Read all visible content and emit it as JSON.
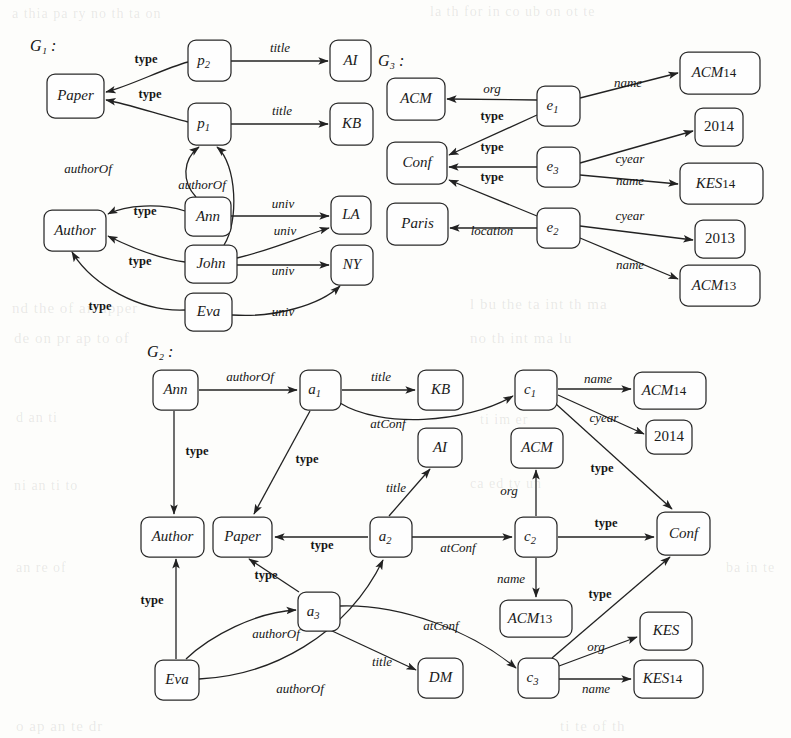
{
  "figure": {
    "width": 791,
    "height": 738,
    "background": "#fdfdfb",
    "ink_color": "#222222"
  },
  "graphs": [
    {
      "id": "G1",
      "title": "G₁ :",
      "title_x": 30,
      "title_y": 47,
      "nodes": [
        {
          "key": "g1-paper",
          "label": "Paper",
          "x": 47,
          "y": 74,
          "w": 57,
          "h": 44,
          "style": "italic"
        },
        {
          "key": "g1-p2",
          "label": "p",
          "sub": "2",
          "x": 188,
          "y": 40,
          "w": 43,
          "h": 41,
          "style": "italic"
        },
        {
          "key": "g1-p1",
          "label": "p",
          "sub": "1",
          "x": 188,
          "y": 103,
          "w": 43,
          "h": 42,
          "style": "italic"
        },
        {
          "key": "g1-ai",
          "label": "AI",
          "x": 330,
          "y": 40,
          "w": 41,
          "h": 41,
          "style": "italic"
        },
        {
          "key": "g1-kb",
          "label": "KB",
          "x": 330,
          "y": 103,
          "w": 43,
          "h": 42,
          "style": "italic"
        },
        {
          "key": "g1-author",
          "label": "Author",
          "x": 44,
          "y": 210,
          "w": 62,
          "h": 41,
          "style": "italic"
        },
        {
          "key": "g1-ann",
          "label": "Ann",
          "x": 185,
          "y": 197,
          "w": 46,
          "h": 39,
          "style": "italic"
        },
        {
          "key": "g1-john",
          "label": "John",
          "x": 185,
          "y": 245,
          "w": 52,
          "h": 38,
          "style": "italic"
        },
        {
          "key": "g1-eva",
          "label": "Eva",
          "x": 185,
          "y": 293,
          "w": 47,
          "h": 38,
          "style": "italic"
        },
        {
          "key": "g1-la",
          "label": "LA",
          "x": 331,
          "y": 196,
          "w": 40,
          "h": 38,
          "style": "italic"
        },
        {
          "key": "g1-ny",
          "label": "NY",
          "x": 331,
          "y": 245,
          "w": 42,
          "h": 40,
          "style": "italic"
        }
      ],
      "edges": [
        {
          "key": "g1-e-p2-paper",
          "label": "type",
          "lx": 146,
          "ly": 60,
          "bold": true,
          "d": "M 188,62 C 165,68 130,86 106,92"
        },
        {
          "key": "g1-e-p2-ai",
          "label": "title",
          "lx": 280,
          "ly": 49,
          "bold": false,
          "d": "M 231,61 L 328,61"
        },
        {
          "key": "g1-e-p1-paper",
          "label": "type",
          "lx": 150,
          "ly": 95,
          "bold": true,
          "d": "M 188,122 C 163,116 128,104 106,100"
        },
        {
          "key": "g1-e-p1-kb",
          "label": "title",
          "lx": 282,
          "ly": 112,
          "bold": false,
          "d": "M 231,124 L 328,124"
        },
        {
          "key": "g1-e-ann-p1",
          "label": "authorOf",
          "lx": 88,
          "ly": 170,
          "bold": false,
          "d": "M 196,197 C 182,182 182,160 199,147"
        },
        {
          "key": "g1-e-john-p1",
          "label": "authorOf",
          "lx": 202,
          "ly": 186,
          "bold": false,
          "d": "M 224,245 C 239,222 237,164 217,147"
        },
        {
          "key": "g1-e-ann-author",
          "label": "type",
          "lx": 145,
          "ly": 212,
          "bold": true,
          "d": "M 185,211 C 160,203 126,205 108,214"
        },
        {
          "key": "g1-e-ann-la",
          "label": "univ",
          "lx": 283,
          "ly": 205,
          "bold": false,
          "d": "M 231,216 L 329,216"
        },
        {
          "key": "g1-e-john-author",
          "label": "type",
          "lx": 140,
          "ly": 262,
          "bold": true,
          "d": "M 185,262 C 155,258 122,243 108,236"
        },
        {
          "key": "g1-e-john-la",
          "label": "univ",
          "lx": 285,
          "ly": 232,
          "bold": false,
          "d": "M 237,258 C 275,249 308,234 329,228"
        },
        {
          "key": "g1-e-john-ny",
          "label": "univ",
          "lx": 283,
          "ly": 272,
          "bold": false,
          "d": "M 237,265 L 329,265"
        },
        {
          "key": "g1-e-eva-author",
          "label": "type",
          "lx": 100,
          "ly": 307,
          "bold": true,
          "d": "M 185,310 C 140,312 92,285 72,252"
        },
        {
          "key": "g1-e-eva-ny",
          "label": "univ",
          "lx": 283,
          "ly": 313,
          "bold": false,
          "d": "M 232,315 C 275,318 320,305 340,286"
        }
      ]
    },
    {
      "id": "G3",
      "title": "G₃ :",
      "title_x": 378,
      "title_y": 62,
      "nodes": [
        {
          "key": "g3-acm",
          "label": "ACM",
          "x": 387,
          "y": 78,
          "w": 58,
          "h": 42,
          "style": "italic"
        },
        {
          "key": "g3-conf",
          "label": "Conf",
          "x": 387,
          "y": 142,
          "w": 60,
          "h": 42,
          "style": "italic"
        },
        {
          "key": "g3-paris",
          "label": "Paris",
          "x": 387,
          "y": 203,
          "w": 61,
          "h": 42,
          "style": "italic"
        },
        {
          "key": "g3-e1",
          "label": "e",
          "sub": "1",
          "x": 537,
          "y": 86,
          "w": 43,
          "h": 40,
          "style": "italic"
        },
        {
          "key": "g3-e3",
          "label": "e",
          "sub": "3",
          "x": 537,
          "y": 147,
          "w": 43,
          "h": 40,
          "style": "italic"
        },
        {
          "key": "g3-e2",
          "label": "e",
          "sub": "2",
          "x": 537,
          "y": 208,
          "w": 43,
          "h": 40,
          "style": "italic"
        },
        {
          "key": "g3-acm14",
          "label": "ACM",
          "sup": "14",
          "x": 680,
          "y": 52,
          "w": 80,
          "h": 42,
          "style": "italic"
        },
        {
          "key": "g3-2014",
          "label": "2014",
          "x": 695,
          "y": 108,
          "w": 48,
          "h": 38,
          "style": "upright"
        },
        {
          "key": "g3-kes14",
          "label": "KES",
          "sup": "14",
          "x": 680,
          "y": 163,
          "w": 83,
          "h": 41,
          "style": "italic"
        },
        {
          "key": "g3-2013",
          "label": "2013",
          "x": 695,
          "y": 220,
          "w": 50,
          "h": 38,
          "style": "upright"
        },
        {
          "key": "g3-acm13",
          "label": "ACM",
          "sup": "13",
          "x": 680,
          "y": 265,
          "w": 80,
          "h": 41,
          "style": "italic"
        }
      ],
      "edges": [
        {
          "key": "g3-e-e1-acm",
          "label": "org",
          "lx": 492,
          "ly": 90,
          "bold": false,
          "d": "M 537,100 L 447,99"
        },
        {
          "key": "g3-e-e1-conf",
          "label": "type",
          "lx": 492,
          "ly": 117,
          "bold": true,
          "d": "M 537,115 L 449,155"
        },
        {
          "key": "g3-e-e1-acm14",
          "label": "name",
          "lx": 628,
          "ly": 84,
          "bold": false,
          "d": "M 580,98 L 678,73"
        },
        {
          "key": "g3-e-e3-conf",
          "label": "type",
          "lx": 492,
          "ly": 148,
          "bold": true,
          "d": "M 537,167 L 449,167"
        },
        {
          "key": "g3-e-e3-2014",
          "label": "cyear",
          "lx": 630,
          "ly": 160,
          "bold": false,
          "d": "M 580,163 L 693,131"
        },
        {
          "key": "g3-e-e3-kes14",
          "label": "name",
          "lx": 630,
          "ly": 182,
          "bold": false,
          "d": "M 580,175 L 678,184"
        },
        {
          "key": "g3-e-e2-conf",
          "label": "type",
          "lx": 492,
          "ly": 178,
          "bold": true,
          "d": "M 537,216 L 449,180"
        },
        {
          "key": "g3-e-e2-paris",
          "label": "location",
          "lx": 492,
          "ly": 232,
          "bold": false,
          "d": "M 537,228 L 450,228"
        },
        {
          "key": "g3-e-e2-2013",
          "label": "cyear",
          "lx": 630,
          "ly": 217,
          "bold": false,
          "d": "M 580,226 L 693,240"
        },
        {
          "key": "g3-e-e2-acm13",
          "label": "name",
          "lx": 630,
          "ly": 266,
          "bold": false,
          "d": "M 580,238 L 678,279"
        }
      ]
    },
    {
      "id": "G2",
      "title": "G₂ :",
      "title_x": 147,
      "title_y": 353,
      "nodes": [
        {
          "key": "g2-ann",
          "label": "Ann",
          "x": 153,
          "y": 370,
          "w": 45,
          "h": 40,
          "style": "italic"
        },
        {
          "key": "g2-a1",
          "label": "a",
          "sub": "1",
          "x": 300,
          "y": 370,
          "w": 41,
          "h": 40,
          "style": "italic"
        },
        {
          "key": "g2-kb",
          "label": "KB",
          "x": 418,
          "y": 370,
          "w": 45,
          "h": 40,
          "style": "italic"
        },
        {
          "key": "g2-c1",
          "label": "c",
          "sub": "1",
          "x": 515,
          "y": 370,
          "w": 42,
          "h": 40,
          "style": "italic"
        },
        {
          "key": "g2-acm14",
          "label": "ACM",
          "sup": "14",
          "x": 634,
          "y": 372,
          "w": 72,
          "h": 37,
          "style": "italic"
        },
        {
          "key": "g2-2014",
          "label": "2014",
          "x": 646,
          "y": 420,
          "w": 46,
          "h": 34,
          "style": "upright"
        },
        {
          "key": "g2-ai",
          "label": "AI",
          "x": 418,
          "y": 428,
          "w": 44,
          "h": 39,
          "style": "italic"
        },
        {
          "key": "g2-acm",
          "label": "ACM",
          "x": 511,
          "y": 428,
          "w": 52,
          "h": 40,
          "style": "italic"
        },
        {
          "key": "g2-author",
          "label": "Author",
          "x": 141,
          "y": 517,
          "w": 63,
          "h": 40,
          "style": "italic"
        },
        {
          "key": "g2-paper",
          "label": "Paper",
          "x": 213,
          "y": 517,
          "w": 59,
          "h": 40,
          "style": "italic"
        },
        {
          "key": "g2-a2",
          "label": "a",
          "sub": "2",
          "x": 370,
          "y": 517,
          "w": 42,
          "h": 40,
          "style": "italic"
        },
        {
          "key": "g2-c2",
          "label": "c",
          "sub": "2",
          "x": 515,
          "y": 517,
          "w": 42,
          "h": 40,
          "style": "italic"
        },
        {
          "key": "g2-conf",
          "label": "Conf",
          "x": 657,
          "y": 512,
          "w": 53,
          "h": 43,
          "style": "italic"
        },
        {
          "key": "g2-a3",
          "label": "a",
          "sub": "3",
          "x": 298,
          "y": 592,
          "w": 42,
          "h": 39,
          "style": "italic"
        },
        {
          "key": "g2-acm13",
          "label": "ACM",
          "sup": "13",
          "x": 500,
          "y": 600,
          "w": 72,
          "h": 37,
          "style": "italic"
        },
        {
          "key": "g2-kes",
          "label": "KES",
          "x": 640,
          "y": 612,
          "w": 52,
          "h": 38,
          "style": "italic"
        },
        {
          "key": "g2-eva",
          "label": "Eva",
          "x": 155,
          "y": 660,
          "w": 44,
          "h": 40,
          "style": "italic"
        },
        {
          "key": "g2-dm",
          "label": "DM",
          "x": 418,
          "y": 658,
          "w": 45,
          "h": 40,
          "style": "italic"
        },
        {
          "key": "g2-c3",
          "label": "c",
          "sub": "3",
          "x": 518,
          "y": 658,
          "w": 41,
          "h": 40,
          "style": "italic"
        },
        {
          "key": "g2-kes14",
          "label": "KES",
          "sup": "14",
          "x": 634,
          "y": 660,
          "w": 69,
          "h": 38,
          "style": "italic"
        }
      ],
      "edges": [
        {
          "key": "g2-e-ann-a1",
          "label": "authorOf",
          "lx": 250,
          "ly": 378,
          "bold": false,
          "d": "M 199,390 L 297,390"
        },
        {
          "key": "g2-e-a1-kb",
          "label": "title",
          "lx": 381,
          "ly": 378,
          "bold": false,
          "d": "M 342,390 L 415,390"
        },
        {
          "key": "g2-e-a1-c1",
          "label": "atConf",
          "lx": 388,
          "ly": 425,
          "bold": false,
          "d": "M 340,403 C 380,428 465,424 513,396"
        },
        {
          "key": "g2-e-ann-author",
          "label": "type",
          "lx": 197,
          "ly": 452,
          "bold": true,
          "d": "M 174,411 L 174,514"
        },
        {
          "key": "g2-e-a1-paper",
          "label": "type",
          "lx": 307,
          "ly": 460,
          "bold": true,
          "d": "M 310,411 L 254,514"
        },
        {
          "key": "g2-e-c1-acm14",
          "label": "name",
          "lx": 598,
          "ly": 380,
          "bold": false,
          "d": "M 558,389 L 631,389"
        },
        {
          "key": "g2-e-c1-2014",
          "label": "cyear",
          "lx": 604,
          "ly": 419,
          "bold": false,
          "d": "M 558,395 L 644,434"
        },
        {
          "key": "g2-e-c1-conf",
          "label": "type",
          "lx": 602,
          "ly": 469,
          "bold": true,
          "d": "M 556,404 L 672,509"
        },
        {
          "key": "g2-e-a2-ai",
          "label": "title",
          "lx": 396,
          "ly": 489,
          "bold": false,
          "d": "M 389,516 L 430,469"
        },
        {
          "key": "g2-e-a2-paper",
          "label": "type",
          "lx": 322,
          "ly": 546,
          "bold": true,
          "d": "M 368,537 L 275,537"
        },
        {
          "key": "g2-e-a2-c2",
          "label": "atConf",
          "lx": 458,
          "ly": 549,
          "bold": false,
          "d": "M 412,537 L 512,537"
        },
        {
          "key": "g2-e-c2-acm",
          "label": "org",
          "lx": 509,
          "ly": 492,
          "bold": false,
          "d": "M 536,516 L 536,470"
        },
        {
          "key": "g2-e-c2-conf",
          "label": "type",
          "lx": 606,
          "ly": 524,
          "bold": true,
          "d": "M 558,537 L 654,537"
        },
        {
          "key": "g2-e-c2-acm13",
          "label": "name",
          "lx": 511,
          "ly": 580,
          "bold": false,
          "d": "M 536,558 L 536,597"
        },
        {
          "key": "g2-e-eva-author",
          "label": "type",
          "lx": 152,
          "ly": 601,
          "bold": true,
          "d": "M 176,659 L 176,559"
        },
        {
          "key": "g2-e-a3-paper",
          "label": "type",
          "lx": 266,
          "ly": 576,
          "bold": true,
          "d": "M 299,592 L 249,559"
        },
        {
          "key": "g2-e-eva-a3",
          "label": "authorOf",
          "lx": 276,
          "ly": 635,
          "bold": false,
          "d": "M 186,659 C 210,636 256,612 296,610"
        },
        {
          "key": "g2-e-eva-a2",
          "label": "authorOf",
          "lx": 300,
          "ly": 690,
          "bold": false,
          "d": "M 199,679 C 270,676 346,636 383,560"
        },
        {
          "key": "g2-e-a3-dm",
          "label": "title",
          "lx": 382,
          "ly": 663,
          "bold": false,
          "d": "M 330,630 L 416,670"
        },
        {
          "key": "g2-e-a3-c3",
          "label": "atConf",
          "lx": 441,
          "ly": 627,
          "bold": false,
          "d": "M 340,606 C 400,604 470,630 516,668"
        },
        {
          "key": "g2-e-c3-conf",
          "label": "type",
          "lx": 600,
          "ly": 595,
          "bold": true,
          "d": "M 552,658 L 670,557"
        },
        {
          "key": "g2-e-c3-kes",
          "label": "org",
          "lx": 596,
          "ly": 648,
          "bold": false,
          "d": "M 559,666 L 637,637"
        },
        {
          "key": "g2-e-c3-kes14",
          "label": "name",
          "lx": 596,
          "ly": 690,
          "bold": false,
          "d": "M 559,679 L 631,679"
        }
      ]
    }
  ],
  "ghost_text": [
    {
      "text": "a thia  pa  ry no  th  ta  on",
      "x": 12,
      "y": 6,
      "size": 14
    },
    {
      "text": "la  th  for in  co ub  on  ot  te",
      "x": 430,
      "y": 4,
      "size": 14
    },
    {
      "text": "nd  the  of  an  apper",
      "x": 12,
      "y": 300,
      "size": 15
    },
    {
      "text": "l  bu  the  ta  int  th  ma",
      "x": 470,
      "y": 296,
      "size": 15
    },
    {
      "text": "de  on  pr  ap  to  of",
      "x": 14,
      "y": 330,
      "size": 15
    },
    {
      "text": "no  th  int  ma  lu",
      "x": 470,
      "y": 330,
      "size": 15
    },
    {
      "text": "d  an  ti",
      "x": 16,
      "y": 410,
      "size": 14
    },
    {
      "text": "ti  im  er",
      "x": 480,
      "y": 412,
      "size": 14
    },
    {
      "text": "ni  an  ti  to",
      "x": 14,
      "y": 478,
      "size": 14
    },
    {
      "text": "ca  ed  ty  un",
      "x": 470,
      "y": 476,
      "size": 14
    },
    {
      "text": "an  re  of",
      "x": 16,
      "y": 560,
      "size": 14
    },
    {
      "text": "ba  in  te",
      "x": 726,
      "y": 560,
      "size": 14
    },
    {
      "text": "o  ap  an  te  dr",
      "x": 16,
      "y": 718,
      "size": 15
    },
    {
      "text": "ti  te  of  th",
      "x": 560,
      "y": 718,
      "size": 15
    }
  ]
}
